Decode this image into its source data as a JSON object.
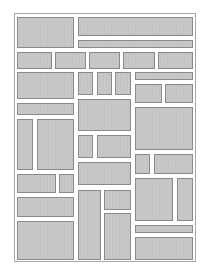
{
  "diagram": {
    "type": "layout-wireframe",
    "block_color": "#c4c4c4",
    "block_border_color": "#8a8a8a",
    "frame_border_color": "#a8a8a8",
    "background_color": "#ffffff",
    "block_count": 40
  }
}
